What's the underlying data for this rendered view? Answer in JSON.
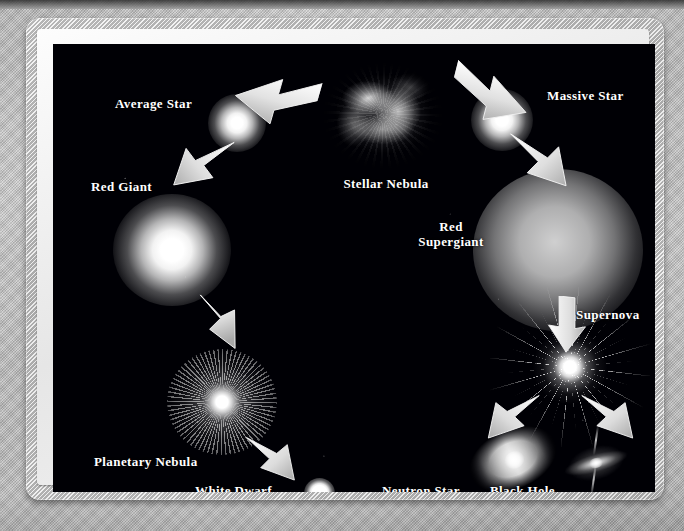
{
  "poster": {
    "title": "Life Cycle of Stars",
    "background_color": "#000005",
    "frame_color": "#dcdcdc",
    "label_color": "#ffffff"
  },
  "diagram": {
    "type": "flow-diagram",
    "nodes": [
      {
        "id": "stellar-nebula",
        "label": "Stellar Nebula",
        "icon": "nebula-cloud-icon"
      },
      {
        "id": "average-star",
        "label": "Average Star",
        "icon": "star-glow-icon"
      },
      {
        "id": "massive-star",
        "label": "Massive Star",
        "icon": "star-glow-icon"
      },
      {
        "id": "red-giant",
        "label": "Red Giant",
        "icon": "large-star-glow-icon"
      },
      {
        "id": "red-supergiant",
        "label": "Red\nSupergiant",
        "icon": "diffuse-supergiant-icon"
      },
      {
        "id": "planetary-nebula",
        "label": "Planetary Nebula",
        "icon": "planetary-nebula-icon"
      },
      {
        "id": "white-dwarf",
        "label": "White Dwarf",
        "icon": "white-dwarf-icon"
      },
      {
        "id": "supernova",
        "label": "Supernova",
        "icon": "starburst-icon"
      },
      {
        "id": "neutron-star",
        "label": "Neutron Star",
        "icon": "neutron-star-icon"
      },
      {
        "id": "black-hole",
        "label": "Black Hole",
        "icon": "black-hole-icon"
      }
    ],
    "edges": [
      {
        "from": "stellar-nebula",
        "to": "average-star",
        "arrow": "arrow-to-average-star"
      },
      {
        "from": "stellar-nebula",
        "to": "massive-star",
        "arrow": "arrow-to-massive-star"
      },
      {
        "from": "average-star",
        "to": "red-giant",
        "arrow": "arrow-to-red-giant"
      },
      {
        "from": "massive-star",
        "to": "red-supergiant",
        "arrow": "arrow-to-red-supergiant"
      },
      {
        "from": "red-giant",
        "to": "planetary-nebula",
        "arrow": "arrow-to-planetary-nebula"
      },
      {
        "from": "planetary-nebula",
        "to": "white-dwarf",
        "arrow": "arrow-to-white-dwarf"
      },
      {
        "from": "red-supergiant",
        "to": "supernova",
        "arrow": "arrow-to-supernova"
      },
      {
        "from": "supernova",
        "to": "neutron-star",
        "arrow": "arrow-to-neutron-star"
      },
      {
        "from": "supernova",
        "to": "black-hole",
        "arrow": "arrow-to-black-hole"
      }
    ]
  },
  "labels": {
    "average_star": "Average Star",
    "red_giant": "Red Giant",
    "stellar_nebula": "Stellar Nebula",
    "massive_star": "Massive Star",
    "red_supergiant": "Red\nSupergiant",
    "supernova": "Supernova",
    "planetary_nebula": "Planetary Nebula",
    "white_dwarf": "White Dwarf",
    "neutron_star": "Neutron Star",
    "black_hole": "Black Hole"
  }
}
